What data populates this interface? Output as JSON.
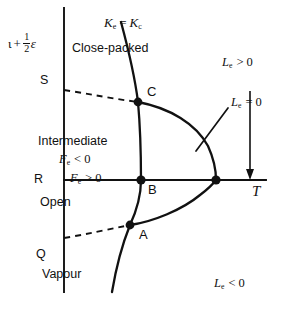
{
  "figure": {
    "type": "phase-diagram",
    "background_color": "#ffffff",
    "ink_color": "#111111"
  },
  "axes": {
    "vertical_axis": {
      "name": "vertical-axis",
      "label": "t + 1/2 e",
      "label_parts": {
        "lead": "ι",
        "plus": "+",
        "num": "1",
        "den": "2",
        "trail": "ε"
      },
      "x": 64,
      "y_top": 8,
      "y_bottom": 292
    },
    "horizontal_axis": {
      "name": "horizontal-axis",
      "label": "T",
      "y": 180,
      "x_left": 64,
      "x_right": 266
    }
  },
  "regions": [
    {
      "id": "close-packed",
      "label": "Close-packed",
      "x": 72,
      "y": 42
    },
    {
      "id": "intermediate",
      "label": "Intermediate",
      "x": 38,
      "y": 135
    },
    {
      "id": "open",
      "label": "Open",
      "x": 40,
      "y": 196
    },
    {
      "id": "vapour",
      "label": "Vapour",
      "x": 42,
      "y": 268
    }
  ],
  "boundary_markers": [
    {
      "id": "S",
      "label": "S",
      "x": 40,
      "y": 75
    },
    {
      "id": "R",
      "label": "R",
      "x": 34,
      "y": 174
    },
    {
      "id": "Q",
      "label": "Q",
      "x": 36,
      "y": 249
    }
  ],
  "critical_points": [
    {
      "id": "C",
      "label": "C",
      "cx": 138,
      "cy": 102,
      "label_x": 147,
      "label_y": 86
    },
    {
      "id": "B",
      "label": "B",
      "cx": 141,
      "cy": 180,
      "label_x": 148,
      "label_y": 184
    },
    {
      "id": "A",
      "label": "A",
      "cx": 130,
      "cy": 225,
      "label_x": 139,
      "label_y": 229
    },
    {
      "id": "cusp",
      "label": "",
      "cx": 216,
      "cy": 180,
      "label_x": 0,
      "label_y": 0
    }
  ],
  "annotations": [
    {
      "id": "ke-eq-kc",
      "base": "K",
      "sub": "e",
      "rel": "=",
      "base2": "K",
      "sub2": "c",
      "x": 104,
      "y": 17
    },
    {
      "id": "le-gt-0",
      "base": "L",
      "sub": "e",
      "rel": "> 0",
      "x": 222,
      "y": 57
    },
    {
      "id": "le-eq-0",
      "base": "L",
      "sub": "e",
      "rel": "= 0",
      "x": 231,
      "y": 97
    },
    {
      "id": "le-lt-0",
      "base": "L",
      "sub": "e",
      "rel": "< 0",
      "x": 214,
      "y": 278
    },
    {
      "id": "fe-lt-0",
      "base": "F",
      "sub": "e",
      "rel": "< 0",
      "x": 59,
      "y": 154
    },
    {
      "id": "fe-gt-0",
      "base": "F",
      "sub": "e",
      "rel": "> 0",
      "x": 70,
      "y": 173
    }
  ],
  "curves": {
    "main_curve_name": "ke-equals-kc-curve",
    "loop_curve_name": "le-equals-zero-loop",
    "upper_dashed_name": "s-to-c-dashed-boundary",
    "lower_dashed_name": "q-to-a-dashed-boundary",
    "leader_name": "le-equals-zero-leader-line",
    "arrow_name": "downward-arrow"
  }
}
